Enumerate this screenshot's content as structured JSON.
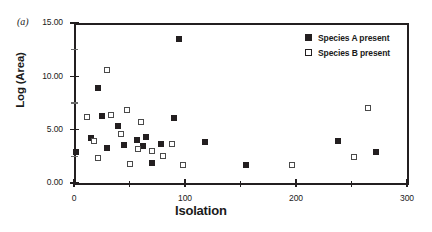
{
  "panel": {
    "label": "(a)"
  },
  "chart_data": {
    "type": "scatter",
    "title": "",
    "xlabel": "Isolation",
    "ylabel": "Log (Area)",
    "xlim": [
      0,
      300
    ],
    "ylim": [
      0,
      15
    ],
    "xticks": [
      0,
      100,
      200,
      300
    ],
    "xtick_labels": [
      "0",
      "100",
      "200",
      "300"
    ],
    "yticks": [
      0,
      5,
      10,
      15
    ],
    "ytick_labels": [
      "0.00",
      "5.00",
      "10.00",
      "15.00"
    ],
    "yticks_minor": [
      2.5,
      7.5,
      12.5
    ],
    "xticks_minor": [
      50,
      150,
      250
    ],
    "grid": false,
    "legend_position": "top-right",
    "series": [
      {
        "name": "Species A present",
        "marker": "filled-square",
        "color": "#231f20",
        "points": [
          [
            2,
            2.9
          ],
          [
            15,
            4.2
          ],
          [
            22,
            8.9
          ],
          [
            25,
            6.3
          ],
          [
            30,
            3.3
          ],
          [
            40,
            5.3
          ],
          [
            45,
            3.6
          ],
          [
            57,
            4.0
          ],
          [
            62,
            3.5
          ],
          [
            65,
            4.3
          ],
          [
            70,
            1.9
          ],
          [
            78,
            3.7
          ],
          [
            90,
            6.1
          ],
          [
            95,
            13.5
          ],
          [
            118,
            3.8
          ],
          [
            155,
            1.7
          ],
          [
            238,
            3.9
          ],
          [
            272,
            2.9
          ]
        ]
      },
      {
        "name": "Species B present",
        "marker": "open-square",
        "color": "#4a4a4a",
        "points": [
          [
            12,
            6.2
          ],
          [
            18,
            3.9
          ],
          [
            22,
            2.3
          ],
          [
            30,
            10.6
          ],
          [
            33,
            6.4
          ],
          [
            42,
            4.6
          ],
          [
            48,
            6.8
          ],
          [
            50,
            1.8
          ],
          [
            58,
            3.2
          ],
          [
            60,
            5.7
          ],
          [
            70,
            3.0
          ],
          [
            80,
            2.5
          ],
          [
            88,
            3.7
          ],
          [
            98,
            1.7
          ],
          [
            196,
            1.7
          ],
          [
            252,
            2.4
          ],
          [
            265,
            7.0
          ]
        ]
      }
    ]
  },
  "legend": {
    "entries": [
      {
        "label": "Species A present",
        "marker": "filled-square"
      },
      {
        "label": "Species B present",
        "marker": "open-square"
      }
    ]
  }
}
